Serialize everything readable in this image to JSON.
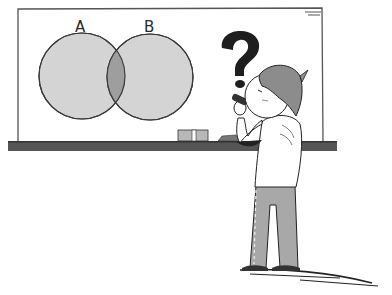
{
  "illustration": {
    "description": "Cartoon person at whiteboard looking at a Venn diagram with a question mark",
    "venn": {
      "sets": [
        {
          "label": "A",
          "cx": 82,
          "cy": 76,
          "r": 43
        },
        {
          "label": "B",
          "cx": 150,
          "cy": 76,
          "r": 43
        }
      ],
      "fill": "#d4d4d4",
      "intersection_fill": "#9e9e9e",
      "stroke": "#3a3a3a"
    },
    "question_mark": "?",
    "colors": {
      "board": "#ffffff",
      "board_frame": "#444444",
      "tray": "#555555",
      "hair": "#8c8c8c",
      "pants": "#a8a8a8",
      "outline": "#222222"
    }
  }
}
